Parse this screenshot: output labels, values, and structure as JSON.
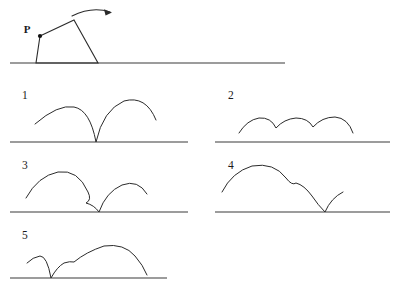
{
  "figure": {
    "background_color": "#ffffff",
    "stroke_color": "#2b2b2b",
    "ground_color": "#3a3a3a"
  },
  "prompt_figure": {
    "name": "rolling-polygon",
    "point_label": "P",
    "rotation_direction": "clockwise-right",
    "ground": {
      "x1": 10,
      "y1": 63,
      "x2": 285,
      "y2": 63
    },
    "polygon_vertices": [
      {
        "name": "P",
        "x": 40,
        "y": 36
      },
      {
        "name": "apex",
        "x": 74,
        "y": 20
      },
      {
        "name": "base-right",
        "x": 98,
        "y": 63
      },
      {
        "name": "base-left",
        "x": 36,
        "y": 63
      }
    ],
    "arrow": {
      "start_x": 72,
      "start_y": 15,
      "end_x": 112,
      "end_y": 12,
      "control_x": 92,
      "control_y": 6
    }
  },
  "options": [
    {
      "number": "1",
      "label_x": 22,
      "label_y": 99,
      "ground": {
        "x1": 10,
        "y1": 142,
        "x2": 188,
        "y2": 142
      },
      "trace_path": "M 35 124 Q 58 104 74 107 Q 90 110 96 142 Q 103 110 124 101 Q 146 95 156 120",
      "description": "two tall arcs meeting at a cusp that touches the baseline"
    },
    {
      "number": "2",
      "label_x": 228,
      "label_y": 99,
      "ground": {
        "x1": 215,
        "y1": 142,
        "x2": 390,
        "y2": 142
      },
      "trace_path": "M 239 133 Q 247 120 259 118 Q 271 117 276 128 Q 284 119 296 118 Q 308 118 313 127 Q 322 117 335 117 Q 348 118 353 133",
      "description": "three shallow arcs with cusps that stay above the baseline"
    },
    {
      "number": "3",
      "label_x": 22,
      "label_y": 169,
      "ground": {
        "x1": 10,
        "y1": 212,
        "x2": 188,
        "y2": 212
      },
      "trace_path": "M 26 198 Q 38 176 58 172 Q 78 169 88 192 Q 92 200 86 203 Q 94 205 99 212 Q 106 192 122 185 Q 138 179 147 194",
      "description": "large arc, small kink, cusp to baseline, then smaller arc"
    },
    {
      "number": "4",
      "label_x": 228,
      "label_y": 169,
      "ground": {
        "x1": 215,
        "y1": 212,
        "x2": 390,
        "y2": 212
      },
      "trace_path": "M 222 192 Q 232 172 252 166 Q 274 162 286 178 Q 292 186 296 183 Q 304 185 312 196 Q 318 205 325 212 Q 331 198 343 192",
      "description": "large arc, small bump, cusp to baseline, then tiny arc"
    },
    {
      "number": "5",
      "label_x": 22,
      "label_y": 239,
      "ground": {
        "x1": 10,
        "y1": 278,
        "x2": 167,
        "y2": 278
      },
      "trace_path": "M 27 263 Q 33 257 40 256 Q 47 256 51 278 Q 57 267 64 263 Q 70 261 74 262 Q 86 252 104 246 Q 124 243 135 256 Q 143 265 147 275",
      "description": "small arc, cusp to baseline, small bump, then large arc"
    }
  ]
}
